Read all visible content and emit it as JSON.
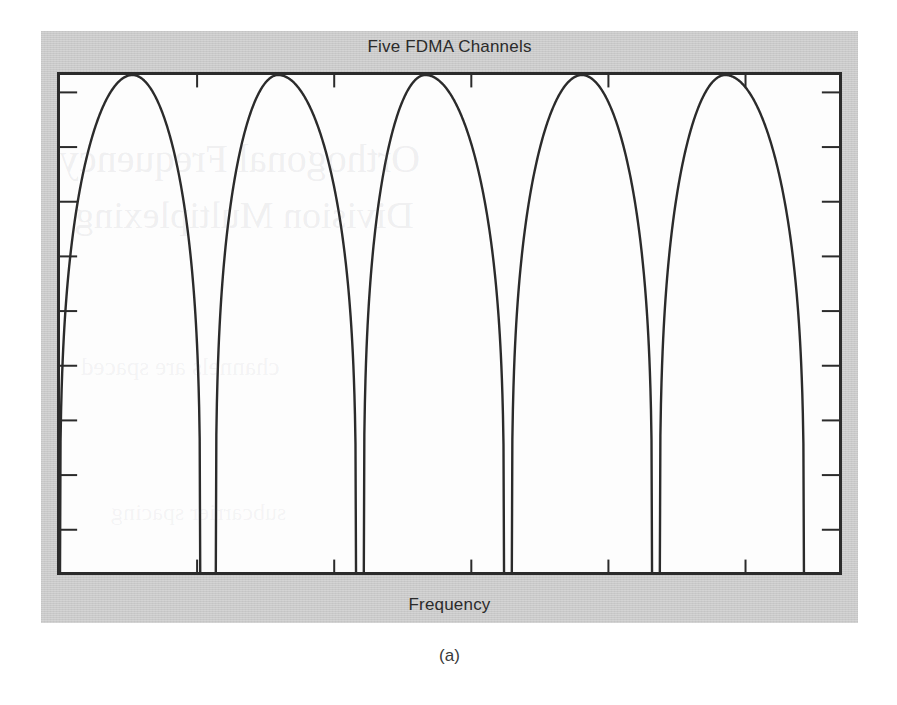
{
  "figure": {
    "caption": "(a)",
    "panel_background": "#c9c9c9",
    "plot_background": "#fdfdfd",
    "frame_color": "#2b2b2b"
  },
  "bleed_through": {
    "line1": "Orthogonal Frequency",
    "line2": "Division Multiplexing",
    "line3": "channels are spaced",
    "line4": "subcarrier spacing"
  },
  "chart_data": {
    "type": "line",
    "title": "Five FDMA Channels",
    "subtitle": "",
    "xlabel": "Frequency",
    "ylabel": "",
    "xlim": [
      0,
      100
    ],
    "ylim": [
      0,
      1
    ],
    "grid": false,
    "legend": "none",
    "annotations": [],
    "xticks": [],
    "yticks": [],
    "x_tick_positions": [
      17.6,
      35.2,
      52.8,
      70.4,
      88.0
    ],
    "y_tick_positions": [
      8.5,
      19.5,
      30.5,
      41.5,
      52.5,
      63.5,
      74.5,
      85.5,
      96.5
    ],
    "channel_count": 5,
    "series": [
      {
        "name": "Channel 1",
        "center": 9.3,
        "peak_value": 1.0,
        "null_left": 0.0,
        "null_right": 18.0
      },
      {
        "name": "Channel 2",
        "center": 28.0,
        "peak_value": 1.0,
        "null_left": 20.0,
        "null_right": 38.0
      },
      {
        "name": "Channel 3",
        "center": 46.9,
        "peak_value": 1.0,
        "null_left": 39.0,
        "null_right": 57.0
      },
      {
        "name": "Channel 4",
        "center": 67.0,
        "peak_value": 1.0,
        "null_left": 58.0,
        "null_right": 76.0
      },
      {
        "name": "Channel 5",
        "center": 85.4,
        "peak_value": 1.0,
        "null_left": 77.0,
        "null_right": 95.5
      }
    ]
  }
}
